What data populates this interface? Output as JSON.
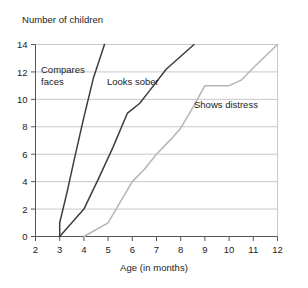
{
  "chart_data": {
    "type": "line",
    "title": "",
    "ylabel": "Number of children",
    "xlabel": "Age (in months)",
    "xlim": [
      2,
      12
    ],
    "ylim": [
      0,
      14
    ],
    "xticks": [
      "2",
      "3",
      "4",
      "5",
      "6",
      "7",
      "8",
      "9",
      "10",
      "11",
      "12"
    ],
    "yticks": [
      "0",
      "2",
      "4",
      "6",
      "8",
      "10",
      "12",
      "14"
    ],
    "grid": "horizontal",
    "legend_position": "inline-annotations",
    "series": [
      {
        "name": "Compares faces",
        "color": "#3d3d3d",
        "label_lines": [
          "Compares",
          "faces"
        ],
        "x": [
          3,
          3,
          3.3,
          3.6,
          4,
          4.4,
          4.85
        ],
        "y": [
          0,
          1,
          3.2,
          5.6,
          8.7,
          11.6,
          14
        ]
      },
      {
        "name": "Looks sober",
        "color": "#3d3d3d",
        "label_lines": [
          "Looks sober"
        ],
        "x": [
          3,
          4,
          4.6,
          5.2,
          5.8,
          6.3,
          6.7,
          7.4,
          8.55
        ],
        "y": [
          0,
          2,
          4.2,
          6.5,
          9,
          9.7,
          10.6,
          12.2,
          14
        ]
      },
      {
        "name": "Shows distress",
        "color": "#b5b5b5",
        "label_lines": [
          "Shows distress"
        ],
        "x": [
          4,
          5,
          5.5,
          6,
          6.5,
          7,
          7.6,
          8,
          8.5,
          9,
          10,
          10.5,
          11,
          12
        ],
        "y": [
          0,
          1,
          2.5,
          4,
          4.9,
          6,
          7.1,
          7.9,
          9.4,
          11,
          11,
          11.4,
          12.3,
          14
        ]
      }
    ],
    "annotations": [
      {
        "text_lines": [
          "Compares",
          "faces"
        ],
        "x_px": 41,
        "y_px": 73
      },
      {
        "text_lines": [
          "Looks sober"
        ],
        "x_px": 107,
        "y_px": 85
      },
      {
        "text_lines": [
          "Shows distress"
        ],
        "x_px": 194,
        "y_px": 108
      }
    ]
  },
  "colors": {
    "axis": "#555555",
    "grid": "#c8c8c8",
    "text": "#1a1a1a",
    "series_dark": "#3d3d3d",
    "series_light": "#b5b5b5",
    "background": "#ffffff"
  }
}
